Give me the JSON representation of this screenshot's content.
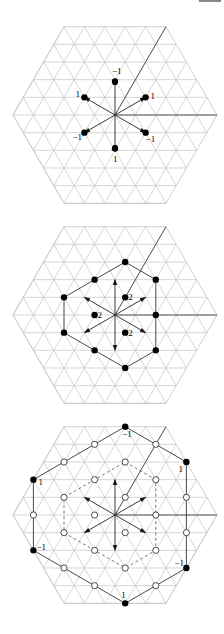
{
  "page": {
    "width": 224,
    "height": 634,
    "page_number_cropped": true
  },
  "lattice": {
    "side": 20.4,
    "hex_radius_units": 5,
    "grid_color": "#c4c4c4",
    "ink_color": "#000000"
  },
  "figures": [
    {
      "id": "weights-adjoint",
      "center": [
        115,
        115
      ],
      "wedge_lines": true,
      "arrows": [
        [
          0,
          -2
        ],
        [
          1.5,
          -1
        ],
        [
          1.5,
          1
        ],
        [
          0,
          2
        ],
        [
          -1.5,
          1
        ],
        [
          -1.5,
          -1
        ]
      ],
      "polygon": [],
      "dashed_polygon": [],
      "points": [
        {
          "pos": [
            0,
            -1.9
          ],
          "filled": true,
          "label": "−1",
          "label_dx": -3,
          "label_dy": -7
        },
        {
          "pos": [
            1.5,
            -1
          ],
          "filled": true,
          "label": "1",
          "label_dx": 5,
          "label_dy": 2
        },
        {
          "pos": [
            1.5,
            1
          ],
          "filled": true,
          "label": "−1",
          "label_dx": 0,
          "label_dy": 9
        },
        {
          "pos": [
            0,
            1.9
          ],
          "filled": true,
          "label": "1",
          "label_dx": -2,
          "label_dy": 13
        },
        {
          "pos": [
            -1.5,
            1
          ],
          "filled": true,
          "label": "−1",
          "label_dx": -12,
          "label_dy": 7
        },
        {
          "pos": [
            -1.5,
            -1
          ],
          "filled": true,
          "label": "1",
          "label_dx": -9,
          "label_dy": 0
        }
      ]
    },
    {
      "id": "weights-second",
      "center": [
        115,
        315
      ],
      "wedge_lines": true,
      "arrows": [
        [
          0,
          -2
        ],
        [
          1.5,
          -1
        ],
        [
          1.5,
          1
        ],
        [
          0,
          2
        ],
        [
          -1.5,
          1
        ],
        [
          -1.5,
          -1
        ]
      ],
      "polygon": [
        [
          0.5,
          -3
        ],
        [
          2,
          -2
        ],
        [
          2,
          2
        ],
        [
          0.5,
          3
        ],
        [
          -1,
          2
        ],
        [
          -2.5,
          1
        ],
        [
          -2.5,
          -1
        ],
        [
          -1,
          -2
        ]
      ],
      "dashed_polygon": [],
      "points": [
        {
          "pos": [
            0.5,
            -3
          ],
          "filled": true,
          "label": ""
        },
        {
          "pos": [
            2,
            -2
          ],
          "filled": true,
          "label": ""
        },
        {
          "pos": [
            2,
            0
          ],
          "filled": true,
          "label": ""
        },
        {
          "pos": [
            2,
            2
          ],
          "filled": true,
          "label": ""
        },
        {
          "pos": [
            0.5,
            3
          ],
          "filled": true,
          "label": ""
        },
        {
          "pos": [
            -1,
            2
          ],
          "filled": true,
          "label": ""
        },
        {
          "pos": [
            -2.5,
            1
          ],
          "filled": true,
          "label": ""
        },
        {
          "pos": [
            -2.5,
            -1
          ],
          "filled": true,
          "label": ""
        },
        {
          "pos": [
            -1,
            -2
          ],
          "filled": true,
          "label": ""
        },
        {
          "pos": [
            0.5,
            -1
          ],
          "filled": true,
          "label": "2",
          "label_dx": 3,
          "label_dy": 3
        },
        {
          "pos": [
            -1,
            0
          ],
          "filled": true,
          "label": "2",
          "label_dx": 3,
          "label_dy": 3
        },
        {
          "pos": [
            0.5,
            1
          ],
          "filled": true,
          "label": "2",
          "label_dx": 3,
          "label_dy": 3
        }
      ]
    },
    {
      "id": "weights-third",
      "center": [
        115,
        515
      ],
      "wedge_lines": true,
      "arrows": [
        [
          0,
          -2
        ],
        [
          1.5,
          -1
        ],
        [
          1.5,
          1
        ],
        [
          0,
          2
        ],
        [
          -1.5,
          1
        ],
        [
          -1.5,
          -1
        ]
      ],
      "polygon": [
        [
          0.5,
          -5
        ],
        [
          3.5,
          -3
        ],
        [
          3.5,
          3
        ],
        [
          0.5,
          5
        ],
        [
          -4,
          2
        ],
        [
          -4,
          -2
        ]
      ],
      "dashed_polygon": [
        [
          0.5,
          -3
        ],
        [
          2,
          -2
        ],
        [
          2,
          2
        ],
        [
          0.5,
          3
        ],
        [
          -1,
          2
        ],
        [
          -2.5,
          1
        ],
        [
          -2.5,
          -1
        ],
        [
          -1,
          -2
        ]
      ],
      "points": [
        {
          "pos": [
            0.5,
            -5
          ],
          "filled": true,
          "label": "−1",
          "label_dx": -3,
          "label_dy": 10
        },
        {
          "pos": [
            -1,
            -4
          ],
          "filled": false,
          "label": ""
        },
        {
          "pos": [
            2,
            -4
          ],
          "filled": false,
          "label": ""
        },
        {
          "pos": [
            -2.5,
            -3
          ],
          "filled": false,
          "label": ""
        },
        {
          "pos": [
            3.5,
            -3
          ],
          "filled": true,
          "label": "1",
          "label_dx": -8,
          "label_dy": 10
        },
        {
          "pos": [
            -4,
            -2
          ],
          "filled": true,
          "label": "1",
          "label_dx": 5,
          "label_dy": 5
        },
        {
          "pos": [
            -4,
            0
          ],
          "filled": false,
          "label": ""
        },
        {
          "pos": [
            3.5,
            -1
          ],
          "filled": false,
          "label": ""
        },
        {
          "pos": [
            3.5,
            1
          ],
          "filled": false,
          "label": ""
        },
        {
          "pos": [
            -4,
            2
          ],
          "filled": true,
          "label": "−1",
          "label_dx": 3,
          "label_dy": 0
        },
        {
          "pos": [
            3.5,
            3
          ],
          "filled": true,
          "label": "−1",
          "label_dx": -12,
          "label_dy": -2
        },
        {
          "pos": [
            -2.5,
            3
          ],
          "filled": false,
          "label": ""
        },
        {
          "pos": [
            -1,
            4
          ],
          "filled": false,
          "label": ""
        },
        {
          "pos": [
            2,
            4
          ],
          "filled": false,
          "label": ""
        },
        {
          "pos": [
            0.5,
            5
          ],
          "filled": true,
          "label": "1",
          "label_dx": -4,
          "label_dy": -5
        },
        {
          "pos": [
            0.5,
            -3
          ],
          "filled": false,
          "label": ""
        },
        {
          "pos": [
            2,
            -2
          ],
          "filled": false,
          "label": ""
        },
        {
          "pos": [
            -1,
            -2
          ],
          "filled": false,
          "label": ""
        },
        {
          "pos": [
            0.5,
            -1
          ],
          "filled": false,
          "label": ""
        },
        {
          "pos": [
            -2.5,
            -1
          ],
          "filled": false,
          "label": ""
        },
        {
          "pos": [
            -1,
            0
          ],
          "filled": false,
          "label": ""
        },
        {
          "pos": [
            2,
            0
          ],
          "filled": false,
          "label": ""
        },
        {
          "pos": [
            0.5,
            1
          ],
          "filled": false,
          "label": ""
        },
        {
          "pos": [
            -2.5,
            1
          ],
          "filled": false,
          "label": ""
        },
        {
          "pos": [
            -1,
            2
          ],
          "filled": false,
          "label": ""
        },
        {
          "pos": [
            2,
            2
          ],
          "filled": false,
          "label": ""
        },
        {
          "pos": [
            0.5,
            3
          ],
          "filled": false,
          "label": ""
        }
      ]
    }
  ]
}
